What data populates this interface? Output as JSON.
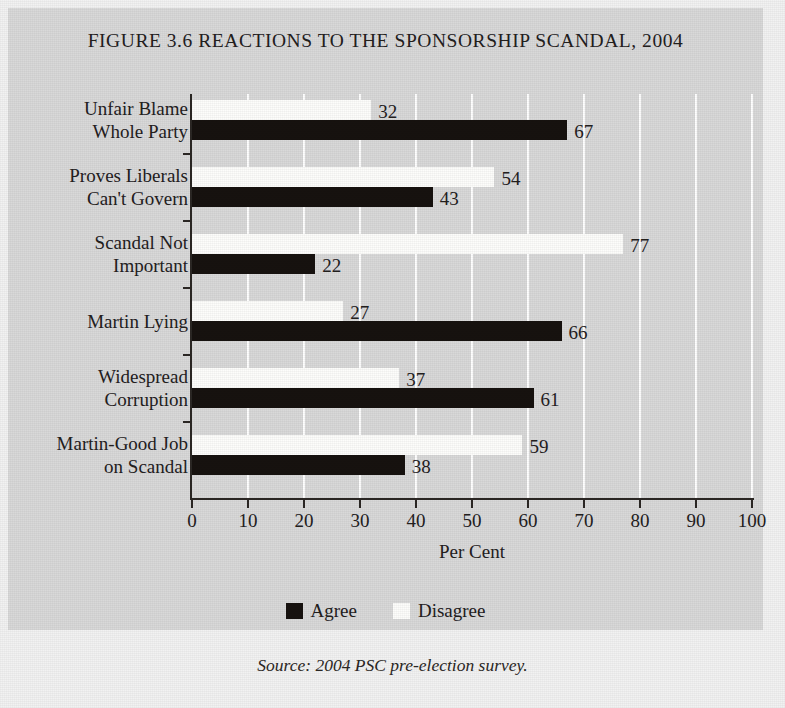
{
  "figure": {
    "title": "FIGURE 3.6 REACTIONS TO THE SPONSORSHIP SCANDAL, 2004",
    "source": "Source: 2004 PSC pre-election survey."
  },
  "legend": {
    "items": [
      {
        "label": "Agree",
        "color": "#17120f",
        "key": "agree"
      },
      {
        "label": "Disagree",
        "color": "#fdfdfb",
        "key": "disagree"
      }
    ]
  },
  "axis": {
    "x_title": "Per Cent",
    "x_ticks": [
      "0",
      "10",
      "20",
      "30",
      "40",
      "50",
      "60",
      "70",
      "80",
      "90",
      "100"
    ]
  },
  "chart_data": {
    "type": "bar",
    "orientation": "horizontal",
    "title": "FIGURE 3.6 REACTIONS TO THE SPONSORSHIP SCANDAL, 2004",
    "xlabel": "Per Cent",
    "ylabel": "",
    "xlim": [
      0,
      100
    ],
    "xticks": [
      0,
      10,
      20,
      30,
      40,
      50,
      60,
      70,
      80,
      90,
      100
    ],
    "grid": "vertical-white-gridlines",
    "legend_position": "below-axis-center",
    "categories": [
      "Unfair Blame Whole Party",
      "Proves Liberals Can't Govern",
      "Scandal Not Important",
      "Martin Lying",
      "Widespread Corruption",
      "Martin-Good Job on Scandal"
    ],
    "category_lines": [
      [
        "Unfair Blame",
        "Whole Party"
      ],
      [
        "Proves Liberals",
        "Can't Govern"
      ],
      [
        "Scandal Not",
        "Important"
      ],
      [
        "Martin Lying"
      ],
      [
        "Widespread",
        "Corruption"
      ],
      [
        "Martin-Good Job",
        "on Scandal"
      ]
    ],
    "series": [
      {
        "name": "Disagree",
        "color": "#fdfdfb",
        "values": [
          32,
          54,
          77,
          27,
          37,
          59
        ]
      },
      {
        "name": "Agree",
        "color": "#17120f",
        "values": [
          67,
          43,
          22,
          66,
          61,
          38
        ]
      }
    ],
    "source": "Source: 2004 PSC pre-election survey."
  }
}
